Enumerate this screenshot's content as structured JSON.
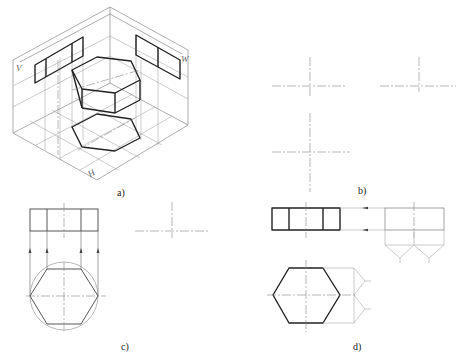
{
  "figure": {
    "subfigures": [
      {
        "id": "a",
        "label": "a)",
        "description": "Isometric view of hexagonal prism in three-plane projection system",
        "planes": {
          "v": "V",
          "w": "W",
          "h": "H"
        }
      },
      {
        "id": "b",
        "label": "b)",
        "description": "Center lines for three views"
      },
      {
        "id": "c",
        "label": "c)",
        "description": "Draw top view hexagon inscribed in circle and project to front view"
      },
      {
        "id": "d",
        "label": "d)",
        "description": "Completed front view and top view with projection to side view"
      }
    ]
  }
}
